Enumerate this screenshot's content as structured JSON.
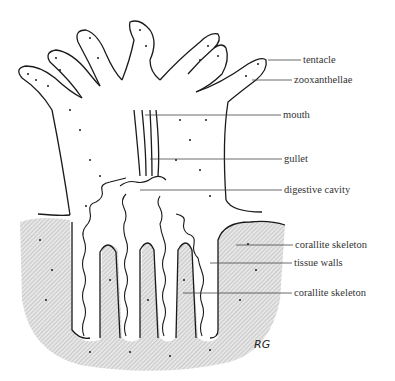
{
  "diagram": {
    "signature": "RG",
    "labels": [
      {
        "text": "tentacle",
        "x": 303,
        "y": 60,
        "line_from": 268
      },
      {
        "text": "zooxanthellae",
        "x": 294,
        "y": 80,
        "line_from": 252
      },
      {
        "text": "mouth",
        "x": 283,
        "y": 115,
        "line_from": 145
      },
      {
        "text": "gullet",
        "x": 284,
        "y": 159,
        "line_from": 150
      },
      {
        "text": "digestive cavity",
        "x": 284,
        "y": 190,
        "line_from": 140
      },
      {
        "text": "corallite skeleton",
        "x": 295,
        "y": 245,
        "line_from": 236
      },
      {
        "text": "tissue walls",
        "x": 294,
        "y": 263,
        "line_from": 210
      },
      {
        "text": "corallite skeleton",
        "x": 294,
        "y": 293,
        "line_from": 183
      }
    ],
    "colors": {
      "ink": "#1a1a1a",
      "skeleton_hatch": "#bdbdbd",
      "background": "#ffffff"
    }
  }
}
